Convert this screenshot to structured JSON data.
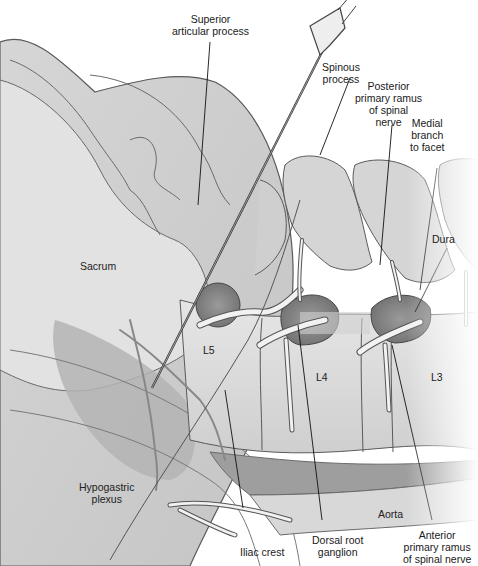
{
  "figure": {
    "colors": {
      "background": "#ffffff",
      "bone_fill": "#d9d9d9",
      "bone_dark": "#bdbdbd",
      "disc_fill": "#8c8c8c",
      "outline": "#5a5a5a",
      "leader": "#111111",
      "aorta_band": "#9e9e9e"
    }
  },
  "labels": {
    "superior_articular_process": [
      "Superior",
      "articular process"
    ],
    "spinous_process": [
      "Spinous",
      "process"
    ],
    "posterior_primary_ramus": [
      "Posterior",
      "primary ramus",
      "of spinal",
      "nerve"
    ],
    "medial_branch": [
      "Medial",
      "branch",
      "to facet"
    ],
    "dura": [
      "Dura"
    ],
    "sacrum": [
      "Sacrum"
    ],
    "l5": [
      "L5"
    ],
    "l4": [
      "L4"
    ],
    "l3": [
      "L3"
    ],
    "hypogastric_plexus": [
      "Hypogastric",
      "plexus"
    ],
    "iliac_crest": [
      "Iliac crest"
    ],
    "dorsal_root_ganglion": [
      "Dorsal root",
      "ganglion"
    ],
    "aorta": [
      "Aorta"
    ],
    "anterior_primary_ramus": [
      "Anterior",
      "primary ramus",
      "of spinal nerve"
    ]
  }
}
